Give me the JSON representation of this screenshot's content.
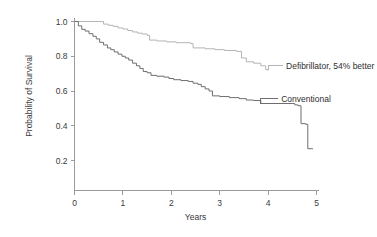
{
  "chart_data": {
    "type": "line",
    "subtype": "kaplan-meier-survival",
    "title": "",
    "xlabel": "Years",
    "ylabel": "Probability of Survival",
    "xlim": [
      0,
      5
    ],
    "ylim": [
      0,
      1.0
    ],
    "xticks": [
      0,
      1,
      2,
      3,
      4,
      5
    ],
    "xticklabels": [
      "0",
      "1",
      "2",
      "3",
      "4",
      "5"
    ],
    "yticks": [
      0.2,
      0.4,
      0.6,
      0.8,
      1.0
    ],
    "yticklabels": [
      "0.2",
      "0.4",
      "0.6",
      "0.8",
      "1.0"
    ],
    "grid": false,
    "legend_position": "inline-annotation",
    "series": [
      {
        "name": "Defibrillator, 54% better",
        "label": "Defibrillator, 54% better",
        "color": "#b4b4b4",
        "points": [
          [
            0.0,
            1.0
          ],
          [
            0.55,
            1.0
          ],
          [
            0.6,
            0.985
          ],
          [
            0.7,
            0.978
          ],
          [
            0.8,
            0.972
          ],
          [
            0.9,
            0.963
          ],
          [
            1.0,
            0.957
          ],
          [
            1.1,
            0.948
          ],
          [
            1.2,
            0.94
          ],
          [
            1.3,
            0.933
          ],
          [
            1.4,
            0.928
          ],
          [
            1.5,
            0.92
          ],
          [
            1.55,
            0.893
          ],
          [
            1.7,
            0.888
          ],
          [
            1.9,
            0.883
          ],
          [
            2.1,
            0.878
          ],
          [
            2.4,
            0.873
          ],
          [
            2.45,
            0.848
          ],
          [
            2.7,
            0.843
          ],
          [
            2.9,
            0.838
          ],
          [
            3.1,
            0.833
          ],
          [
            3.35,
            0.828
          ],
          [
            3.45,
            0.79
          ],
          [
            3.55,
            0.768
          ],
          [
            3.7,
            0.76
          ],
          [
            3.85,
            0.745
          ],
          [
            3.95,
            0.723
          ],
          [
            4.0,
            0.718
          ]
        ]
      },
      {
        "name": "Conventional",
        "label": "Conventional",
        "color": "#6e6e6e",
        "points": [
          [
            0.0,
            1.0
          ],
          [
            0.08,
            0.975
          ],
          [
            0.15,
            0.955
          ],
          [
            0.22,
            0.945
          ],
          [
            0.3,
            0.93
          ],
          [
            0.38,
            0.915
          ],
          [
            0.45,
            0.9
          ],
          [
            0.52,
            0.88
          ],
          [
            0.6,
            0.865
          ],
          [
            0.68,
            0.848
          ],
          [
            0.75,
            0.838
          ],
          [
            0.82,
            0.825
          ],
          [
            0.9,
            0.812
          ],
          [
            0.98,
            0.8
          ],
          [
            1.05,
            0.79
          ],
          [
            1.12,
            0.778
          ],
          [
            1.2,
            0.76
          ],
          [
            1.28,
            0.745
          ],
          [
            1.35,
            0.73
          ],
          [
            1.42,
            0.712
          ],
          [
            1.5,
            0.705
          ],
          [
            1.58,
            0.69
          ],
          [
            1.7,
            0.685
          ],
          [
            1.85,
            0.68
          ],
          [
            1.95,
            0.672
          ],
          [
            2.05,
            0.665
          ],
          [
            2.2,
            0.66
          ],
          [
            2.35,
            0.655
          ],
          [
            2.45,
            0.645
          ],
          [
            2.55,
            0.638
          ],
          [
            2.62,
            0.625
          ],
          [
            2.7,
            0.612
          ],
          [
            2.78,
            0.6
          ],
          [
            2.85,
            0.572
          ],
          [
            3.0,
            0.568
          ],
          [
            3.2,
            0.562
          ],
          [
            3.4,
            0.556
          ],
          [
            3.55,
            0.548
          ],
          [
            3.7,
            0.545
          ],
          [
            3.85,
            0.528
          ],
          [
            4.55,
            0.52
          ],
          [
            4.62,
            0.515
          ],
          [
            4.68,
            0.412
          ],
          [
            4.78,
            0.408
          ],
          [
            4.82,
            0.268
          ],
          [
            4.92,
            0.265
          ]
        ]
      }
    ],
    "annotations": [
      {
        "text": "Defibrillator, 54% better",
        "anchor_x": 4.0,
        "anchor_y": 0.718,
        "text_x": 4.35,
        "text_y": 0.745
      },
      {
        "text": "Conventional",
        "anchor_x": 3.85,
        "anchor_y": 0.528,
        "text_x": 4.25,
        "text_y": 0.556
      }
    ]
  },
  "colors": {
    "background": "#ffffff",
    "axis": "#9a9a9a",
    "text": "#3a3a3a",
    "defibrillator": "#b4b4b4",
    "conventional": "#6e6e6e"
  }
}
